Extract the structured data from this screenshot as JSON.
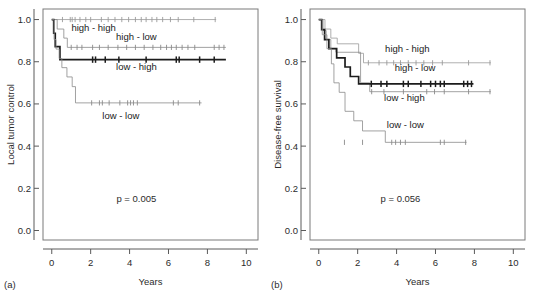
{
  "figure": {
    "panels": [
      {
        "tag": "(a)",
        "ylabel": "Local tumor control",
        "xlabel": "Years",
        "pvalue": "p = 0.005"
      },
      {
        "tag": "(b)",
        "ylabel": "Disease-free survival",
        "xlabel": "Years",
        "pvalue": "p = 0.056"
      }
    ]
  },
  "axes": {
    "x_ticks": [
      0,
      2,
      4,
      6,
      8,
      10
    ],
    "x_tick_labels": [
      "0",
      "2",
      "4",
      "6",
      "8",
      "10"
    ],
    "y_ticks": [
      0.0,
      0.2,
      0.4,
      0.6,
      0.8,
      1.0
    ],
    "y_tick_labels": [
      "0.0",
      "0.2",
      "0.4",
      "0.6",
      "0.8",
      "1.0"
    ],
    "xlim": [
      -0.45,
      10.6
    ],
    "ylim": [
      -0.045,
      1.05
    ],
    "grid": false
  },
  "colors": {
    "high-high": "#9a9a9a",
    "high-low": "#8a8a8a",
    "low-high": "#1c1c1c",
    "low-low": "#8a8a8a",
    "axis": "#5a5a5a",
    "frame": "#7a7a7a",
    "text": "#1a1a1a"
  },
  "chart_data": [
    {
      "type": "line",
      "subtype": "kaplan-meier",
      "title": "",
      "panel": "(a)",
      "xlabel": "Years",
      "ylabel": "Local tumor control",
      "xlim": [
        -0.45,
        10.6
      ],
      "ylim": [
        -0.045,
        1.05
      ],
      "grid": false,
      "annotations": [
        {
          "text": "high - high",
          "x": 2.15,
          "y": 0.945
        },
        {
          "text": "high - low",
          "x": 4.35,
          "y": 0.905
        },
        {
          "text": "low - high",
          "x": 4.35,
          "y": 0.76
        },
        {
          "text": "low - low",
          "x": 3.55,
          "y": 0.53
        },
        {
          "text": "p = 0.005",
          "x": 4.35,
          "y": 0.135
        }
      ],
      "legend_position": "inline-labels",
      "series": [
        {
          "name": "high - high",
          "color": "#9a9a9a",
          "width": 0.8,
          "steps": [
            [
              0,
              1.0
            ],
            [
              8.45,
              1.0
            ]
          ],
          "censor": [
            0.55,
            0.95,
            1.05,
            1.2,
            1.45,
            1.75,
            2.0,
            2.55,
            2.9,
            3.25,
            3.6,
            3.95,
            4.3,
            4.6,
            4.85,
            5.15,
            5.4,
            5.7,
            6.1,
            6.5,
            7.3,
            8.4
          ]
        },
        {
          "name": "high - low",
          "color": "#8a8a8a",
          "width": 0.8,
          "steps": [
            [
              0,
              1.0
            ],
            [
              0.28,
              1.0
            ],
            [
              0.28,
              0.955
            ],
            [
              0.62,
              0.955
            ],
            [
              0.62,
              0.912
            ],
            [
              0.8,
              0.912
            ],
            [
              0.8,
              0.868
            ],
            [
              8.95,
              0.868
            ]
          ],
          "censor": [
            1.0,
            1.3,
            1.55,
            2.1,
            2.45,
            2.9,
            3.4,
            3.85,
            4.3,
            4.75,
            5.2,
            5.6,
            5.9,
            6.15,
            6.4,
            6.7,
            7.0,
            7.35,
            8.35,
            8.6,
            8.85
          ]
        },
        {
          "name": "low - high",
          "color": "#1c1c1c",
          "width": 1.7,
          "steps": [
            [
              0,
              1.0
            ],
            [
              0.1,
              1.0
            ],
            [
              0.1,
              0.935
            ],
            [
              0.18,
              0.935
            ],
            [
              0.18,
              0.872
            ],
            [
              0.42,
              0.872
            ],
            [
              0.42,
              0.81
            ],
            [
              8.95,
              0.81
            ]
          ],
          "censor": [
            2.1,
            2.25,
            2.75,
            3.45,
            4.85,
            6.4,
            6.55,
            7.6,
            8.35
          ]
        },
        {
          "name": "low - low",
          "color": "#8a8a8a",
          "width": 0.8,
          "steps": [
            [
              0,
              1.0
            ],
            [
              0.12,
              1.0
            ],
            [
              0.12,
              0.905
            ],
            [
              0.22,
              0.905
            ],
            [
              0.22,
              0.86
            ],
            [
              0.38,
              0.86
            ],
            [
              0.38,
              0.815
            ],
            [
              0.52,
              0.815
            ],
            [
              0.52,
              0.772
            ],
            [
              0.78,
              0.772
            ],
            [
              0.78,
              0.728
            ],
            [
              1.05,
              0.728
            ],
            [
              1.05,
              0.682
            ],
            [
              1.22,
              0.682
            ],
            [
              1.22,
              0.605
            ],
            [
              7.7,
              0.605
            ]
          ],
          "censor": [
            2.05,
            2.45,
            2.6,
            2.95,
            3.5,
            3.9,
            4.05,
            4.2,
            4.4,
            6.25,
            6.5,
            7.6
          ]
        }
      ]
    },
    {
      "type": "line",
      "subtype": "kaplan-meier",
      "title": "",
      "panel": "(b)",
      "xlabel": "Years",
      "ylabel": "Disease-free survival",
      "xlim": [
        -0.45,
        10.6
      ],
      "ylim": [
        -0.045,
        1.05
      ],
      "grid": false,
      "annotations": [
        {
          "text": "high - high",
          "x": 4.55,
          "y": 0.845
        },
        {
          "text": "high - low",
          "x": 4.95,
          "y": 0.757
        },
        {
          "text": "low - high",
          "x": 4.4,
          "y": 0.612
        },
        {
          "text": "low - low",
          "x": 4.45,
          "y": 0.487
        },
        {
          "text": "p = 0.056",
          "x": 4.2,
          "y": 0.135
        }
      ],
      "legend_position": "inline-labels",
      "series": [
        {
          "name": "high - high",
          "color": "#9a9a9a",
          "width": 0.8,
          "steps": [
            [
              0,
              1.0
            ],
            [
              0.32,
              1.0
            ],
            [
              0.32,
              0.955
            ],
            [
              0.62,
              0.955
            ],
            [
              0.62,
              0.912
            ],
            [
              0.95,
              0.912
            ],
            [
              0.95,
              0.885
            ],
            [
              2.05,
              0.885
            ],
            [
              2.05,
              0.84
            ],
            [
              2.3,
              0.84
            ],
            [
              2.3,
              0.795
            ],
            [
              8.85,
              0.795
            ]
          ],
          "censor": [
            2.55,
            3.1,
            3.5,
            3.85,
            4.2,
            4.6,
            5.0,
            5.4,
            5.85,
            6.35,
            7.7,
            8.8
          ]
        },
        {
          "name": "high - low",
          "color": "#8a8a8a",
          "width": 0.8,
          "steps": [
            [
              0,
              1.0
            ],
            [
              0.22,
              1.0
            ],
            [
              0.22,
              0.948
            ],
            [
              0.38,
              0.948
            ],
            [
              0.38,
              0.905
            ],
            [
              0.62,
              0.905
            ],
            [
              0.62,
              0.862
            ],
            [
              0.88,
              0.862
            ],
            [
              0.88,
              0.845
            ],
            [
              2.15,
              0.845
            ],
            [
              2.15,
              0.7
            ],
            [
              2.62,
              0.7
            ],
            [
              2.62,
              0.658
            ],
            [
              8.85,
              0.658
            ]
          ],
          "censor": [
            2.72,
            3.35,
            4.35,
            5.55,
            5.95,
            6.45,
            7.7,
            8.8
          ]
        },
        {
          "name": "low - high",
          "color": "#1c1c1c",
          "width": 1.7,
          "steps": [
            [
              0,
              1.0
            ],
            [
              0.15,
              1.0
            ],
            [
              0.15,
              0.952
            ],
            [
              0.3,
              0.952
            ],
            [
              0.3,
              0.905
            ],
            [
              0.52,
              0.905
            ],
            [
              0.52,
              0.862
            ],
            [
              0.92,
              0.862
            ],
            [
              0.92,
              0.818
            ],
            [
              1.35,
              0.818
            ],
            [
              1.35,
              0.775
            ],
            [
              1.62,
              0.775
            ],
            [
              1.62,
              0.73
            ],
            [
              2.05,
              0.73
            ],
            [
              2.05,
              0.695
            ],
            [
              7.95,
              0.695
            ]
          ],
          "censor": [
            2.7,
            3.2,
            3.5,
            4.35,
            4.6,
            5.25,
            5.75,
            6.0,
            6.25,
            6.45,
            7.45,
            7.65,
            7.85
          ]
        },
        {
          "name": "low - low",
          "color": "#8a8a8a",
          "width": 0.8,
          "steps": [
            [
              0,
              1.0
            ],
            [
              0.18,
              1.0
            ],
            [
              0.18,
              0.928
            ],
            [
              0.42,
              0.928
            ],
            [
              0.42,
              0.862
            ],
            [
              0.65,
              0.862
            ],
            [
              0.65,
              0.79
            ],
            [
              0.78,
              0.79
            ],
            [
              0.78,
              0.7
            ],
            [
              1.05,
              0.7
            ],
            [
              1.05,
              0.655
            ],
            [
              1.35,
              0.655
            ],
            [
              1.35,
              0.565
            ],
            [
              1.8,
              0.565
            ],
            [
              1.8,
              0.52
            ],
            [
              2.25,
              0.52
            ],
            [
              2.25,
              0.472
            ],
            [
              3.42,
              0.472
            ],
            [
              3.42,
              0.418
            ],
            [
              7.6,
              0.418
            ]
          ],
          "censor": [
            1.32,
            2.25,
            3.75,
            3.95,
            4.2,
            4.45,
            6.25,
            6.45,
            7.55
          ]
        }
      ]
    }
  ]
}
